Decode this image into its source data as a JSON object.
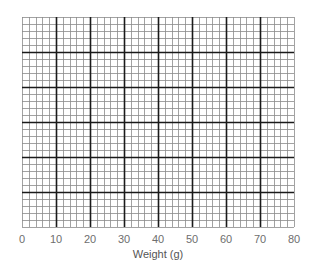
{
  "chart_data": {
    "type": "grid",
    "title": "",
    "xlabel": "Weight (g)",
    "ylabel": "",
    "x_ticks": [
      "0",
      "10",
      "20",
      "30",
      "40",
      "50",
      "60",
      "70",
      "80"
    ],
    "xlim": [
      0,
      80
    ],
    "y_ticks": [],
    "grid": {
      "major_columns": 8,
      "major_rows": 6,
      "minor_per_major": 5
    },
    "series": []
  },
  "colors": {
    "minor_line": "#8a8a8a",
    "major_line": "#1a1a1a",
    "tick_text": "#6e6e6e"
  }
}
